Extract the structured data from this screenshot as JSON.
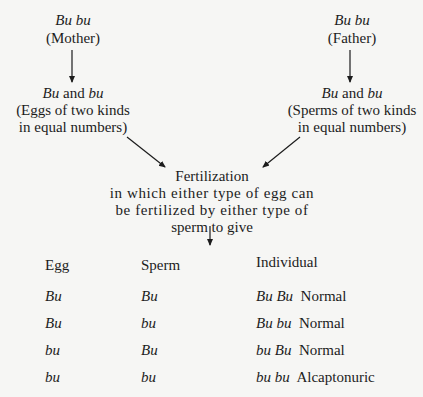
{
  "mother": {
    "genotype": "Bu bu",
    "label": "(Mother)",
    "gametes": "Bu and bu",
    "gamete_a": "Bu",
    "gamete_join": "and",
    "gamete_b": "bu",
    "desc1": "(Eggs of two kinds",
    "desc2": "in equal numbers)"
  },
  "father": {
    "genotype": "Bu bu",
    "label": "(Father)",
    "gametes": "Bu and bu",
    "gamete_a": "Bu",
    "gamete_join": "and",
    "gamete_b": "bu",
    "desc1": "(Sperms of two kinds",
    "desc2": "in equal numbers)"
  },
  "fertilization": {
    "title": "Fertilization",
    "line1": "in which either type of egg can",
    "line2": "be fertilized by either type of",
    "line3": "sperm to give"
  },
  "table": {
    "headers": [
      "Egg",
      "Sperm",
      "Individual"
    ],
    "rows": [
      {
        "egg": "Bu",
        "sperm": "Bu",
        "genotype": "Bu Bu",
        "phenotype": "Normal"
      },
      {
        "egg": "Bu",
        "sperm": "bu",
        "genotype": "Bu bu",
        "phenotype": "Normal"
      },
      {
        "egg": "bu",
        "sperm": "Bu",
        "genotype": "bu Bu",
        "phenotype": "Normal"
      },
      {
        "egg": "bu",
        "sperm": "bu",
        "genotype": "bu bu",
        "phenotype": "Alcaptonuric"
      }
    ]
  }
}
